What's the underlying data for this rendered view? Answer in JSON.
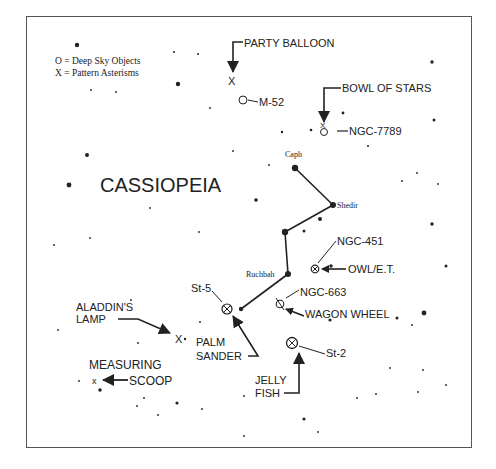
{
  "title": "CASSIOPEIA",
  "legend": {
    "deep_sky": "O = Deep Sky Objects",
    "asterisms": "X = Pattern Asterisms"
  },
  "stars_named": [
    {
      "name": "Caph",
      "x": 295,
      "y": 168
    },
    {
      "name": "Shedir",
      "x": 333,
      "y": 205
    },
    {
      "name": "Ruchbah",
      "x": 288,
      "y": 274
    }
  ],
  "constellation_lines": [
    [
      295,
      168
    ],
    [
      333,
      205
    ],
    [
      285,
      232
    ],
    [
      288,
      274
    ],
    [
      241,
      309
    ]
  ],
  "labels": {
    "party_balloon": "PARTY BALLOON",
    "m52": "M-52",
    "bowl_of_stars": "BOWL OF STARS",
    "ngc7789": "NGC-7789",
    "ngc451": "NGC-451",
    "owl_et": "OWL/E.T.",
    "ngc663": "NGC-663",
    "wagon_wheel": "WAGON WHEEL",
    "st5": "St-5",
    "aladdins_lamp_1": "ALADDIN'S",
    "aladdins_lamp_2": "LAMP",
    "palm_sander_1": "PALM",
    "palm_sander_2": "SANDER",
    "measuring_scoop_1": "MEASURING",
    "measuring_scoop_2": "SCOOP",
    "st2": "St-2",
    "jelly_fish_1": "JELLY",
    "jelly_fish_2": "FISH"
  },
  "colors": {
    "ink": "#222222",
    "border": "#555555",
    "background": "#ffffff"
  }
}
